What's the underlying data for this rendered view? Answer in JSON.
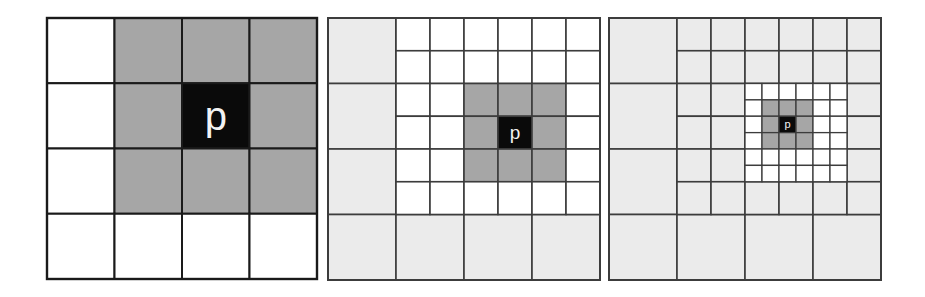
{
  "colors": {
    "background": "#ffffff",
    "white_cell": "#ffffff",
    "light_cell": "#ebebeb",
    "gray_cell": "#a6a6a6",
    "center_cell": "#0a0a0a",
    "label": "#f2f2f2",
    "line_panel1": "#1a1a1a",
    "line_panel23": "#3c3c3c"
  },
  "center_label": "p",
  "panels": [
    {
      "name": "panel-level-1",
      "x": 47,
      "y": 18,
      "w": 270,
      "h": 261,
      "line_key": "line_panel1",
      "line_width": 2,
      "coarse": {
        "rows": 4,
        "cols": 4,
        "default_fill": "white_cell",
        "gray_cells": [
          [
            0,
            1
          ],
          [
            0,
            2
          ],
          [
            0,
            3
          ],
          [
            1,
            1
          ],
          [
            1,
            3
          ],
          [
            2,
            1
          ],
          [
            2,
            2
          ],
          [
            2,
            3
          ]
        ],
        "center_cell": [
          1,
          2
        ],
        "label_size": 40
      }
    },
    {
      "name": "panel-level-2",
      "x": 328,
      "y": 18,
      "w": 272,
      "h": 262,
      "line_key": "line_panel23",
      "line_width": 1.6,
      "coarse": {
        "rows": 4,
        "cols": 4,
        "default_fill": "light_cell"
      },
      "medium": {
        "parent_rows": [
          0,
          2
        ],
        "parent_cols": [
          1,
          3
        ],
        "rows": 6,
        "cols": 6,
        "default_fill": "white_cell",
        "gray_block": {
          "rows": [
            2,
            4
          ],
          "cols": [
            2,
            4
          ]
        },
        "center_cell": [
          3,
          3
        ],
        "label_size": 19
      }
    },
    {
      "name": "panel-level-3",
      "x": 609,
      "y": 18,
      "w": 272,
      "h": 262,
      "line_key": "line_panel23",
      "line_width": 1.6,
      "coarse": {
        "rows": 4,
        "cols": 4,
        "default_fill": "light_cell"
      },
      "medium": {
        "parent_rows": [
          0,
          2
        ],
        "parent_cols": [
          1,
          3
        ],
        "rows": 6,
        "cols": 6,
        "default_fill": "light_cell"
      },
      "fine": {
        "parent_rows": [
          2,
          4
        ],
        "parent_cols": [
          2,
          4
        ],
        "rows": 6,
        "cols": 6,
        "default_fill": "white_cell",
        "gray_block": {
          "rows": [
            1,
            3
          ],
          "cols": [
            1,
            3
          ]
        },
        "center_cell": [
          2,
          2
        ],
        "label_size": 11
      }
    }
  ]
}
